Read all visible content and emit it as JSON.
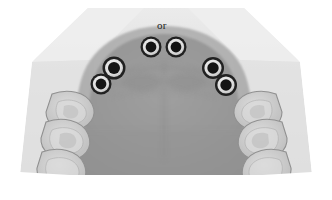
{
  "image": {
    "kind": "dental-occlusal-radiograph",
    "region": "maxillary-arch",
    "width": 332,
    "height": 200,
    "background_color": "#ffffff"
  },
  "annotations": [
    {
      "id": "or",
      "text": "or",
      "x": 157,
      "y": 20,
      "color": "#1c1c1c"
    }
  ],
  "film": {
    "outline_color": "#e8e8e8",
    "beam_fill": "#d6d6d6",
    "arch_fill": "#a3a3a3",
    "palate_fill": "#9a9a9a",
    "ridge_fill": "#b5b5b5",
    "tooth_fill": "#c8c8c8",
    "tooth_stroke": "#8d8d8d",
    "enamel_fill": "#dedede"
  },
  "implants": {
    "count": 6,
    "outer_color": "#1a1a1a",
    "ring_color": "#e9e9e9",
    "core_color": "#0d0d0d",
    "items": [
      {
        "id": "implant-1",
        "label": "upper-left-anterior",
        "cx": 151,
        "cy": 47,
        "r": 10.5
      },
      {
        "id": "implant-2",
        "label": "upper-right-anterior",
        "cx": 176,
        "cy": 47,
        "r": 10.5
      },
      {
        "id": "implant-3",
        "label": "upper-left-premolar",
        "cx": 114,
        "cy": 68,
        "r": 11.5
      },
      {
        "id": "implant-4",
        "label": "upper-left-canine",
        "cx": 101,
        "cy": 84,
        "r": 10.5
      },
      {
        "id": "implant-5",
        "label": "upper-right-premolar",
        "cx": 213,
        "cy": 68,
        "r": 11.0
      },
      {
        "id": "implant-6",
        "label": "upper-right-canine",
        "cx": 226,
        "cy": 85,
        "r": 11.0
      }
    ]
  },
  "teeth": {
    "left_side": [
      {
        "id": "tooth-left-1",
        "label": "left-first-molar",
        "cx": 76,
        "cy": 108
      },
      {
        "id": "tooth-left-2",
        "label": "left-second-molar",
        "cx": 70,
        "cy": 133
      },
      {
        "id": "tooth-left-3",
        "label": "left-third-molar",
        "cx": 64,
        "cy": 160
      }
    ],
    "right_side": [
      {
        "id": "tooth-right-1",
        "label": "right-first-molar",
        "cx": 252,
        "cy": 108
      },
      {
        "id": "tooth-right-2",
        "label": "right-second-molar",
        "cx": 258,
        "cy": 133
      },
      {
        "id": "tooth-right-3",
        "label": "right-third-molar",
        "cx": 264,
        "cy": 160
      }
    ]
  }
}
